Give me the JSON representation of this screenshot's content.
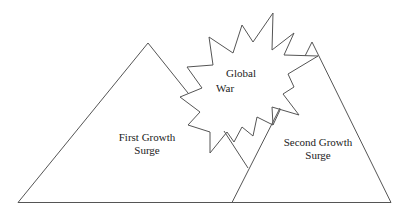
{
  "diagram": {
    "shapes": [
      {
        "id": "first-growth-surge",
        "type": "triangle",
        "label_lines": [
          "First Growth",
          "Surge"
        ]
      },
      {
        "id": "global-war",
        "type": "starburst",
        "label_lines": [
          "Global",
          "War"
        ]
      },
      {
        "id": "second-growth-surge",
        "type": "triangle",
        "label_lines": [
          "Second Growth",
          "Surge"
        ]
      }
    ],
    "colors": {
      "stroke": "#555555",
      "background": "#ffffff",
      "text": "#222222"
    }
  }
}
